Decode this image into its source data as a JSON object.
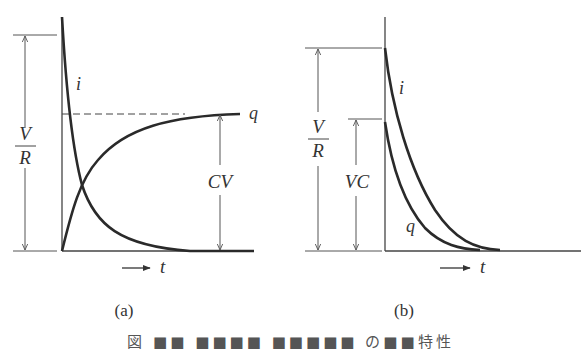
{
  "figure": {
    "panels": [
      {
        "id": "a",
        "label": "(a)",
        "curves": {
          "i_label": "i",
          "q_label": "q"
        },
        "dimensions": {
          "vr_num": "V",
          "vr_den": "R",
          "cv": "CV"
        },
        "axis": {
          "time_label": "t"
        }
      },
      {
        "id": "b",
        "label": "(b)",
        "curves": {
          "i_label": "i",
          "q_label": "q"
        },
        "dimensions": {
          "vr_num": "V",
          "vr_den": "R",
          "vc": "VC"
        },
        "axis": {
          "time_label": "t"
        }
      }
    ],
    "caption": "図 ■■ ■■■■ ■■■■■ の■■特性"
  },
  "colors": {
    "stroke": "#2a2a2a",
    "thin": "#555555",
    "text": "#333333"
  }
}
